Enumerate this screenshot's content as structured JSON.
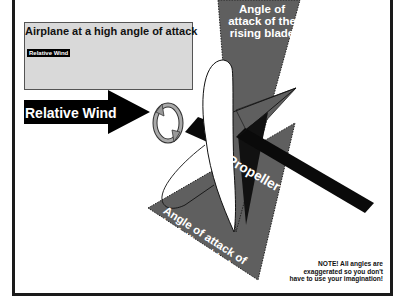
{
  "diagram": {
    "inset": {
      "title": "Airplane at a high angle of attack",
      "wind_label": "Relative Wind",
      "image": "airplane-nose-up-icon"
    },
    "relative_wind": {
      "label": "Relative Wind",
      "icon": "arrow-right-icon"
    },
    "rotation_icon": "rotation-arrows-icon",
    "rising_blade": {
      "label": "Angle of attack of the rising blade"
    },
    "falling_blade": {
      "label_line1": "Angle of attack of",
      "label_line2": "the falling  blade"
    },
    "propeller_shaft": {
      "label": "Propeller Shaft"
    },
    "note": {
      "line1": "NOTE! All angles are",
      "line2": "exaggerated so you don't",
      "line3": "have to use your imagination!"
    },
    "colors": {
      "wedge_gray": "#5f5f5f",
      "inset_bg": "#d9d9d9",
      "arrow_black": "#000000",
      "shaft_black": "#0a0a0a",
      "blade_white": "#ffffff",
      "frame": "#1a1a1a"
    }
  }
}
